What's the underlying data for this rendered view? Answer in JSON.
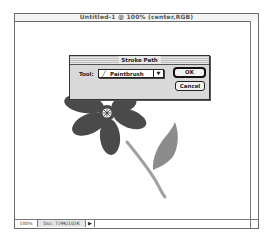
{
  "window": {
    "title": "Untitled-1 @ 100% (center,RGB)"
  },
  "status_bar": {
    "zoom_level": "100%",
    "doc_size": "Doc: 729K/102K",
    "menu_arrow": "▶"
  },
  "dialog": {
    "title": "Stroke Path",
    "tool_label": "Tool:",
    "tool_icon": "paintbrush-icon",
    "tool_value": "Paintbrush",
    "dropdown_caret": "▼",
    "ok_label": "OK",
    "cancel_label": "Cancel"
  },
  "artwork": {
    "flower_color": "#4a4a4a",
    "leaf_color": "#8c8c8c",
    "stem_color": "#a0a0a0"
  }
}
